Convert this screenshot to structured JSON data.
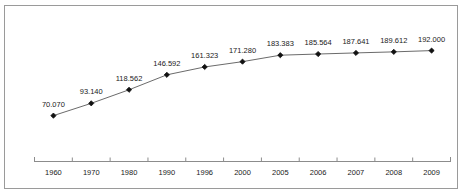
{
  "chart_data": {
    "type": "line",
    "title": "",
    "xlabel": "",
    "ylabel": "",
    "grid": false,
    "legend": false,
    "categories": [
      "1960",
      "1970",
      "1980",
      "1990",
      "1996",
      "2000",
      "2005",
      "2006",
      "2007",
      "2008",
      "2009"
    ],
    "values": [
      70.07,
      93.14,
      118.562,
      146.592,
      161.323,
      171.28,
      183.383,
      185.564,
      187.641,
      189.612,
      192.0
    ],
    "data_labels": [
      "70.070",
      "93.140",
      "118.562",
      "146.592",
      "161.323",
      "171.280",
      "183.383",
      "185.564",
      "187.641",
      "189.612",
      "192.000"
    ],
    "ylim": [
      0,
      210
    ],
    "series": [
      {
        "name": "",
        "values": [
          70.07,
          93.14,
          118.562,
          146.592,
          161.323,
          171.28,
          183.383,
          185.564,
          187.641,
          189.612,
          192.0
        ]
      }
    ],
    "marker": "diamond",
    "line_color": "#6b6b6b",
    "marker_color": "#111111",
    "axis_color": "#8c8c8c",
    "border_color": "#9a9a9a",
    "text_color": "#1a1a1a",
    "background_color": "#ffffff"
  }
}
